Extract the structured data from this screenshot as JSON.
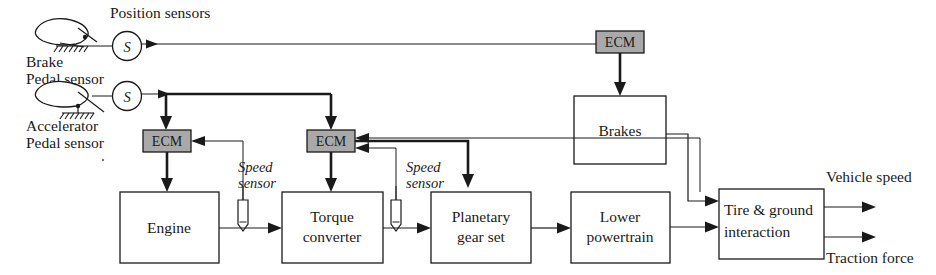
{
  "diagram": {
    "colors": {
      "ecm_fill": "#a9a9a9",
      "block_fill": "#ffffff",
      "line": "#1a1a1a",
      "background": "#ffffff"
    }
  },
  "labels": {
    "position_sensors": "Position sensors",
    "brake_pedal_line1": "Brake",
    "brake_pedal_line2": "Pedal sensor",
    "accelerator_pedal_line1": "Accelerator",
    "accelerator_pedal_line2": "Pedal sensor",
    "speed_sensor_1_line1": "Speed",
    "speed_sensor_1_line2": "sensor",
    "speed_sensor_2_line1": "Speed",
    "speed_sensor_2_line2": "sensor",
    "vehicle_speed": "Vehicle speed",
    "traction_force": "Traction force"
  },
  "sensors": {
    "brake_sensor_symbol": "S",
    "accelerator_sensor_symbol": "S"
  },
  "blocks": {
    "ecm_brake": "ECM",
    "ecm_engine": "ECM",
    "ecm_transmission": "ECM",
    "brakes": "Brakes",
    "engine": "Engine",
    "torque_converter_line1": "Torque",
    "torque_converter_line2": "converter",
    "planetary_line1": "Planetary",
    "planetary_line2": "gear set",
    "lower_powertrain_line1": "Lower",
    "lower_powertrain_line2": "powertrain",
    "tire_ground_line1": "Tire & ground",
    "tire_ground_line2": "interaction"
  }
}
